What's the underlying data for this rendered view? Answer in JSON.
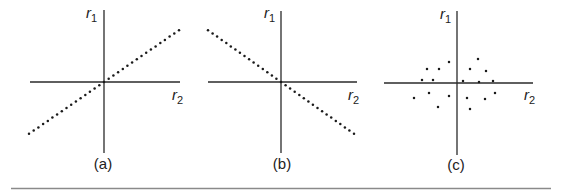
{
  "figure": {
    "panels": [
      {
        "id": "a",
        "caption": "(a)",
        "y_axis_label": "r",
        "y_axis_sub": "1",
        "x_axis_label": "r",
        "x_axis_sub": "2",
        "relationship": "positive correlation"
      },
      {
        "id": "b",
        "caption": "(b)",
        "y_axis_label": "r",
        "y_axis_sub": "1",
        "x_axis_label": "r",
        "x_axis_sub": "2",
        "relationship": "negative correlation"
      },
      {
        "id": "c",
        "caption": "(c)",
        "y_axis_label": "r",
        "y_axis_sub": "1",
        "x_axis_label": "r",
        "x_axis_sub": "2",
        "relationship": "no correlation"
      }
    ],
    "colors": {
      "ink": "#1a1a1a",
      "rule": "#8a8a8a",
      "background": "#ffffff"
    }
  },
  "chart_data": [
    {
      "type": "scatter",
      "title": "(a)",
      "xlabel": "r2",
      "ylabel": "r1",
      "description": "Points lie on a straight line with positive slope through the origin",
      "line": {
        "from": [
          -1,
          -0.72
        ],
        "to": [
          1,
          0.72
        ]
      },
      "grid": false
    },
    {
      "type": "scatter",
      "title": "(b)",
      "xlabel": "r2",
      "ylabel": "r1",
      "description": "Points lie on a straight line with negative slope through the origin",
      "line": {
        "from": [
          -1,
          0.72
        ],
        "to": [
          1,
          -0.72
        ]
      },
      "grid": false
    },
    {
      "type": "scatter",
      "title": "(c)",
      "xlabel": "r2",
      "ylabel": "r1",
      "description": "Scattered points with no linear relationship around the origin",
      "points_px_offset_from_origin": [
        [
          -30,
          14
        ],
        [
          -18,
          14
        ],
        [
          -8,
          21
        ],
        [
          -35,
          3
        ],
        [
          -24,
          3
        ],
        [
          -43,
          -15
        ],
        [
          -28,
          -10
        ],
        [
          -8,
          -13
        ],
        [
          -19,
          -24
        ],
        [
          21,
          24
        ],
        [
          13,
          14
        ],
        [
          29,
          12
        ],
        [
          6,
          2
        ],
        [
          22,
          1
        ],
        [
          36,
          2
        ],
        [
          38,
          -10
        ],
        [
          10,
          -15
        ],
        [
          28,
          -16
        ],
        [
          13,
          -26
        ]
      ],
      "grid": false
    }
  ]
}
